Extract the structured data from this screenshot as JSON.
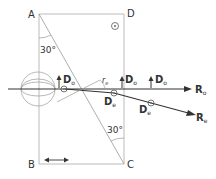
{
  "points": {
    "A": "A",
    "B": "B",
    "C": "C",
    "D": "D"
  },
  "angles": {
    "top": "30°",
    "bottom": "30°"
  },
  "vectors": {
    "Do": "D",
    "Do_sub": "o",
    "De": "D",
    "De_sub": "e",
    "Ro": "R",
    "Ro_sub": "o",
    "Re": "R",
    "Re_sub": "e",
    "re": "r",
    "re_sub": "e"
  },
  "colors": {
    "line": "#999999",
    "ray": "#333333"
  }
}
